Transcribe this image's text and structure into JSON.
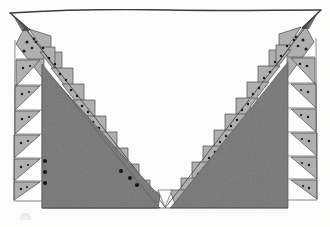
{
  "artwork": {
    "title": "Geometric V-Shape Quilt Pattern",
    "medium": "pencil and ink drawing on paper",
    "description": "Hand-drawn geometric composition: a wide V-shaped dark gray mass filling the lower portion, bordered by sawtooth bands of light gray dotted triangles running along both diagonal arms, with vertical columns of alternating gray and white triangles at the left and right edges, and a ruled horizontal line across the top.",
    "canvas": {
      "width": 330,
      "height": 227,
      "background_color": "#ffffff"
    },
    "palette": {
      "paper_white": "#ffffff",
      "dark_gray_fill": "#828282",
      "light_gray_fill": "#b6b6b6",
      "mid_gray_fill": "#a9a9a9",
      "ink_line": "#3c3c3c",
      "dot_color": "#1a1a1a",
      "faint_mark": "#b0b0b0"
    },
    "elements": [
      {
        "name": "top-border-line",
        "kind": "ruled-line",
        "from": [
          10,
          13
        ],
        "to": [
          321,
          10
        ],
        "stroke": "#3c3c3c"
      },
      {
        "name": "left-diagonal-arm",
        "kind": "sawtooth-band",
        "from": [
          18,
          20
        ],
        "to": [
          163,
          207
        ],
        "teeth": 13
      },
      {
        "name": "right-diagonal-arm",
        "kind": "sawtooth-band",
        "from": [
          313,
          18
        ],
        "to": [
          163,
          207
        ],
        "teeth": 13
      },
      {
        "name": "left-edge-column",
        "kind": "triangle-column",
        "x_range": [
          14,
          44
        ],
        "y_range": [
          22,
          200
        ],
        "cells": 7
      },
      {
        "name": "right-edge-column",
        "kind": "triangle-column",
        "x_range": [
          287,
          317
        ],
        "y_range": [
          20,
          200
        ],
        "cells": 7
      },
      {
        "name": "dark-v-mass",
        "kind": "filled-polygon",
        "fill": "#828282",
        "bottom_y": 208,
        "left_x": 42,
        "right_x": 288,
        "apex": [
          163,
          207
        ]
      },
      {
        "name": "dot-cluster-left",
        "kind": "dots",
        "count": 3,
        "positions": [
          [
            45,
            161
          ],
          [
            45,
            171
          ],
          [
            45,
            181
          ]
        ]
      },
      {
        "name": "dot-cluster-center",
        "kind": "dots",
        "count": 3,
        "positions": [
          [
            121,
            171
          ],
          [
            130,
            178
          ],
          [
            137,
            184
          ]
        ]
      },
      {
        "name": "faint-pencil-mark",
        "kind": "smudge",
        "position": [
          25,
          216
        ]
      }
    ],
    "counts": {
      "left_arm_triangles": 13,
      "right_arm_triangles": 13,
      "left_column_cells": 7,
      "right_column_cells": 7,
      "total_dotted_triangles": 40
    }
  }
}
